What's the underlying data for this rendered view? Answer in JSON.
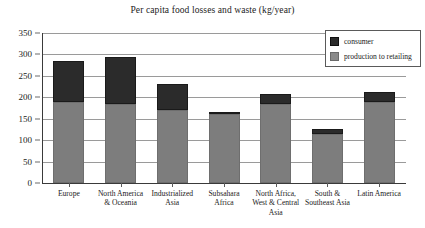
{
  "chart_data": {
    "type": "bar",
    "title": "Per capita food losses and waste (kg/year)",
    "xlabel": "",
    "ylabel": "",
    "ylim": [
      0,
      350
    ],
    "yticks": [
      0,
      50,
      100,
      150,
      200,
      250,
      300,
      350
    ],
    "grid": true,
    "stacked": true,
    "legend_position": "top-right",
    "categories": [
      "Europe",
      "North America & Oceania",
      "Industrialized Asia",
      "Subsahara Africa",
      "North Africa, West & Central Asia",
      "South & Southeast Asia",
      "Latin America"
    ],
    "series": [
      {
        "name": "production to retailing",
        "color": "#7d7d7d",
        "values": [
          190,
          185,
          170,
          160,
          185,
          115,
          190
        ]
      },
      {
        "name": "consumer",
        "color": "#2b2b2b",
        "values": [
          95,
          110,
          60,
          5,
          23,
          10,
          23
        ]
      }
    ],
    "totals": [
      285,
      295,
      230,
      165,
      208,
      125,
      213
    ]
  },
  "legend": {
    "items": [
      {
        "label": "consumer",
        "swatch": "consumer"
      },
      {
        "label": "production to retailing",
        "swatch": "production"
      }
    ]
  },
  "axis": {
    "y_tick_labels": [
      "350",
      "300",
      "250",
      "200",
      "150",
      "100",
      "50",
      "0"
    ]
  }
}
